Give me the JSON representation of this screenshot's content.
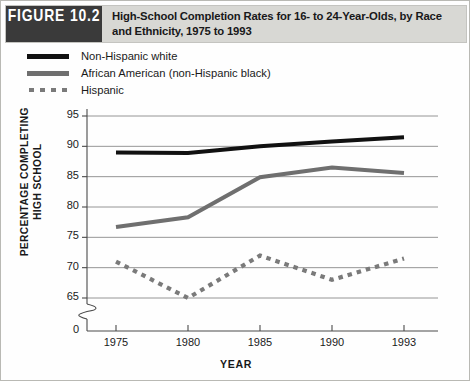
{
  "figure": {
    "badge": "FIGURE 10.2",
    "title": "High-School Completion Rates for 16- to 24-Year-Olds, by Race and Ethnicity, 1975 to 1993",
    "header_bg": "#d8d8d4",
    "badge_bg": "#3a3a3a"
  },
  "legend": {
    "position": "top-left",
    "items": [
      {
        "label": "Non-Hispanic white",
        "color": "#111111",
        "style": "solid"
      },
      {
        "label": "African American (non-Hispanic black)",
        "color": "#6f6f6f",
        "style": "solid"
      },
      {
        "label": "Hispanic",
        "color": "#7a7a7a",
        "style": "dashed"
      }
    ]
  },
  "chart_data": {
    "type": "line",
    "title": "High-School Completion Rates for 16- to 24-Year-Olds, by Race and Ethnicity, 1975 to 1993",
    "xlabel": "YEAR",
    "ylabel": "PERCENTAGE COMPLETING HIGH SCHOOL",
    "x": [
      1975,
      1980,
      1985,
      1990,
      1993
    ],
    "xticklabels": [
      "1975",
      "1980",
      "1985",
      "1990",
      "1993"
    ],
    "yticklabels": [
      "95",
      "90",
      "85",
      "80",
      "75",
      "70",
      "65",
      "0"
    ],
    "yticks": [
      95,
      90,
      85,
      80,
      75,
      70,
      65,
      0
    ],
    "ylim": [
      63.5,
      96.5
    ],
    "xlim": [
      1973,
      1995
    ],
    "axis_break": true,
    "axis_break_label": "0",
    "grid": true,
    "series": [
      {
        "name": "Non-Hispanic white",
        "color": "#111111",
        "style": "solid",
        "values": [
          89.0,
          88.9,
          90.0,
          90.8,
          91.5
        ]
      },
      {
        "name": "African American (non-Hispanic black)",
        "color": "#6f6f6f",
        "style": "solid",
        "values": [
          76.7,
          78.3,
          84.9,
          86.5,
          85.6
        ]
      },
      {
        "name": "Hispanic",
        "color": "#7a7a7a",
        "style": "dashed",
        "values": [
          71.0,
          65.0,
          72.0,
          68.0,
          71.5
        ]
      }
    ]
  }
}
